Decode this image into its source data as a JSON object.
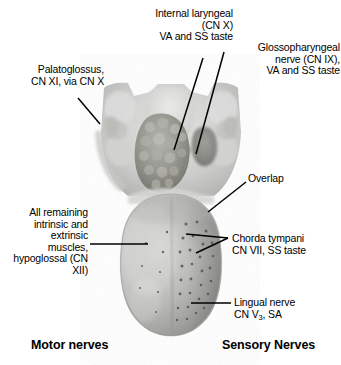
{
  "figure": {
    "background_color": "#ffffff",
    "ink_color": "#000000"
  },
  "labels": {
    "internal_laryngeal": "Internal laryngeal\n(CN X)\nVA and SS taste",
    "glossopharyngeal": "Glossopharyngeal\nnerve (CN IX),\nVA and SS taste",
    "palatoglossus": "Palatoglossus,\nCN XI, via CN X",
    "overlap": "Overlap",
    "all_remaining": "All remaining\nintrinsic and\nextrinsic\nmuscles,\nhypoglossal (CN XII)",
    "chorda_tympani": "Chorda tympani\nCN VII, SS taste",
    "lingual_nerve_line1": "Lingual nerve",
    "lingual_nerve_line2_pre": "CN V",
    "lingual_nerve_line2_sub": "3",
    "lingual_nerve_line2_post": ", SA"
  },
  "sections": {
    "motor": "Motor nerves",
    "sensory": "Sensory Nerves"
  },
  "anatomy": {
    "specimen": "dorsal-tongue-photograph",
    "regions": [
      "epiglottis",
      "vallecula",
      "lingual-tonsil",
      "palatoglossal-arch",
      "tongue-body",
      "tongue-tip",
      "median-sulcus",
      "lingual-papillae"
    ]
  }
}
